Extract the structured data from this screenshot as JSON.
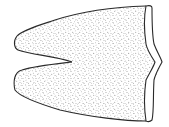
{
  "figure": {
    "colors": {
      "background": "#ffffff",
      "outline": "#2a2a2a",
      "stipple": "#555555"
    }
  }
}
